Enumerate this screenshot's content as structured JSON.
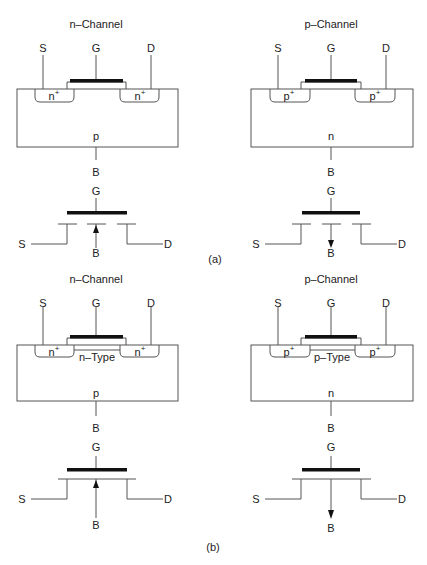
{
  "figure": {
    "part_a": {
      "caption": "(a)",
      "n_channel": {
        "title": "n–Channel",
        "terminals": {
          "source": "S",
          "gate": "G",
          "drain": "D",
          "body": "B"
        },
        "regions": {
          "source_well": "n",
          "drain_well": "n",
          "well_superscript": "+",
          "substrate": "p"
        },
        "symbol": {
          "gate": "G",
          "source": "S",
          "drain": "D",
          "body": "B",
          "arrow": "arrow-up-icon",
          "channel": "broken (enhancement)"
        }
      },
      "p_channel": {
        "title": "p–Channel",
        "terminals": {
          "source": "S",
          "gate": "G",
          "drain": "D",
          "body": "B"
        },
        "regions": {
          "source_well": "p",
          "drain_well": "p",
          "well_superscript": "+",
          "substrate": "n"
        },
        "symbol": {
          "gate": "G",
          "source": "S",
          "drain": "D",
          "body": "B",
          "arrow": "arrow-down-icon",
          "channel": "broken (enhancement)"
        }
      }
    },
    "part_b": {
      "caption": "(b)",
      "n_channel": {
        "title": "n–Channel",
        "terminals": {
          "source": "S",
          "gate": "G",
          "drain": "D",
          "body": "B"
        },
        "regions": {
          "source_well": "n",
          "drain_well": "n",
          "well_superscript": "+",
          "channel": "n–Type",
          "substrate": "p"
        },
        "symbol": {
          "gate": "G",
          "source": "S",
          "drain": "D",
          "body": "B",
          "arrow": "arrow-up-icon",
          "channel": "solid (depletion)"
        }
      },
      "p_channel": {
        "title": "p–Channel",
        "terminals": {
          "source": "S",
          "gate": "G",
          "drain": "D",
          "body": "B"
        },
        "regions": {
          "source_well": "p",
          "drain_well": "p",
          "well_superscript": "+",
          "channel": "p–Type",
          "substrate": "n"
        },
        "symbol": {
          "gate": "G",
          "source": "S",
          "drain": "D",
          "body": "B",
          "arrow": "arrow-down-icon",
          "channel": "solid (depletion)"
        }
      }
    }
  }
}
